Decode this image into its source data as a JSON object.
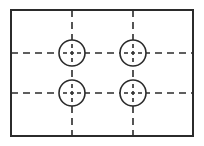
{
  "canvas": {
    "width": 204,
    "height": 146,
    "background_color": "#ffffff",
    "title": "Rectangular plate with four holes on centerlines"
  },
  "style": {
    "outline_color": "#2b2b2b",
    "outline_width": 2,
    "circle_color": "#2b2b2b",
    "circle_width": 1.6,
    "centerline_color": "#2b2b2b",
    "centerline_width": 1.6,
    "centerline_dash": "7,5",
    "center_mark_dash": "4,3"
  },
  "plate": {
    "name": "outer-rectangle",
    "x": 11,
    "y": 10,
    "width": 182,
    "height": 126
  },
  "centerlines": {
    "horizontal": [
      {
        "name": "horizontal-centerline-upper",
        "y": 53,
        "x1": 11,
        "x2": 193
      },
      {
        "name": "horizontal-centerline-lower",
        "y": 93,
        "x1": 11,
        "x2": 193
      }
    ],
    "vertical": [
      {
        "name": "vertical-centerline-left",
        "x": 72,
        "y1": 10,
        "y2": 136
      },
      {
        "name": "vertical-centerline-right",
        "x": 133,
        "y1": 10,
        "y2": 136
      }
    ]
  },
  "holes": [
    {
      "name": "hole-top-left",
      "cx": 72,
      "cy": 53,
      "r": 13
    },
    {
      "name": "hole-top-right",
      "cx": 133,
      "cy": 53,
      "r": 13
    },
    {
      "name": "hole-bottom-left",
      "cx": 72,
      "cy": 93,
      "r": 13
    },
    {
      "name": "hole-bottom-right",
      "cx": 133,
      "cy": 93,
      "r": 13
    }
  ],
  "center_mark": {
    "arm_length": 9
  }
}
